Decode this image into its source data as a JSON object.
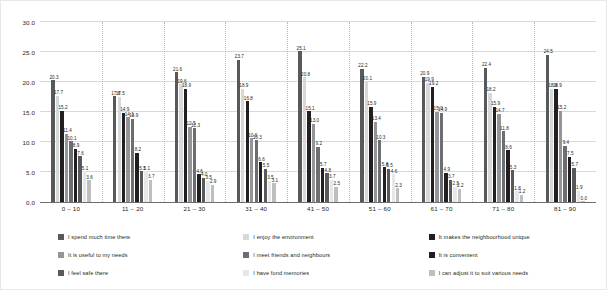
{
  "chart_data": {
    "type": "bar",
    "title": "",
    "xlabel": "",
    "ylabel": "",
    "ylim": [
      0,
      30
    ],
    "ytick_step": 5,
    "grid": true,
    "legend_position": "bottom",
    "yticks": [
      "0.0",
      "5.0",
      "10.0",
      "15.0",
      "20.0",
      "25.0",
      "30.0"
    ],
    "categories": [
      "0 – 10",
      "11 – 20",
      "21 – 30",
      "31 – 40",
      "41 – 50",
      "51 – 60",
      "61 – 70",
      "71 – 80",
      "81 – 90"
    ],
    "series": [
      {
        "name": "I spend much time there",
        "color": "#58595b",
        "values": [
          20.3,
          17.6,
          21.6,
          23.7,
          25.1,
          22.2,
          20.9,
          22.4,
          24.5
        ]
      },
      {
        "name": "I enjoy the environment",
        "color": "#d7d8da",
        "values": [
          17.7,
          17.5,
          19.6,
          18.9,
          20.8,
          20.1,
          19.9,
          18.2,
          18.9
        ]
      },
      {
        "name": "It makes the neighbourhood unique",
        "color": "#231f20",
        "values": [
          15.2,
          14.9,
          18.9,
          16.8,
          15.1,
          15.9,
          19.2,
          15.9,
          18.9
        ]
      },
      {
        "name": "It is useful to my needs",
        "color": "#939598",
        "values": [
          11.4,
          14.1,
          12.5,
          10.6,
          13.0,
          13.4,
          15.0,
          14.7,
          15.2
        ]
      },
      {
        "name": "I meet friends and neighbours",
        "color": "#6d6e71",
        "values": [
          10.1,
          13.9,
          12.3,
          10.3,
          9.2,
          10.3,
          14.9,
          11.8,
          9.4
        ]
      },
      {
        "name": "It is convenient",
        "color": "#231f20",
        "values": [
          8.9,
          8.2,
          4.6,
          6.6,
          5.7,
          5.8,
          4.9,
          8.6,
          7.5
        ]
      },
      {
        "name": "I feel safe there",
        "color": "#58595b",
        "values": [
          7.6,
          5.1,
          4.0,
          5.5,
          4.8,
          5.5,
          3.7,
          5.3,
          5.7
        ]
      },
      {
        "name": "I have fond memories",
        "color": "#e6e7e8",
        "values": [
          5.1,
          5.1,
          3.5,
          3.5,
          3.7,
          4.6,
          2.5,
          1.8,
          1.9
        ]
      },
      {
        "name": "I can adjust it to suit various needs",
        "color": "#bcbec0",
        "values": [
          3.6,
          3.7,
          2.9,
          3.1,
          2.5,
          2.3,
          2.2,
          1.2,
          0.0
        ]
      }
    ]
  },
  "legend": {
    "items": [
      {
        "label": "I spend much time there",
        "color": "#58595b"
      },
      {
        "label": "I enjoy the environment",
        "color": "#d7d8da"
      },
      {
        "label": "It makes the neighbourhood unique",
        "color": "#231f20"
      },
      {
        "label": "It is useful to my needs",
        "color": "#939598"
      },
      {
        "label": "I meet friends and neighbours",
        "color": "#6d6e71"
      },
      {
        "label": "It is convenient",
        "color": "#231f20"
      },
      {
        "label": "I feel safe there",
        "color": "#58595b"
      },
      {
        "label": "I have fond memories",
        "color": "#e6e7e8"
      },
      {
        "label": "I can adjust it to suit various needs",
        "color": "#bcbec0"
      }
    ]
  }
}
